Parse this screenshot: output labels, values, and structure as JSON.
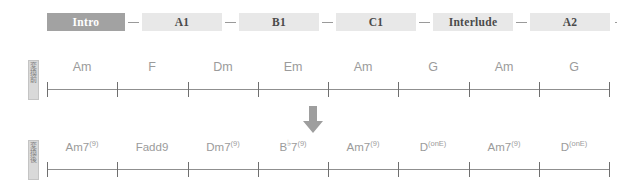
{
  "form_timeline": {
    "sections": [
      {
        "label": "Intro",
        "current": true,
        "width": 78
      },
      {
        "label": "A1",
        "current": false,
        "width": 80
      },
      {
        "label": "B1",
        "current": false,
        "width": 80
      },
      {
        "label": "C1",
        "current": false,
        "width": 80
      },
      {
        "label": "Interlude",
        "current": false,
        "width": 80
      },
      {
        "label": "A2",
        "current": false,
        "width": 80
      }
    ],
    "separator": "–"
  },
  "rows": [
    {
      "id": "original",
      "tag": "変換前",
      "measures": [
        {
          "label": "Am",
          "sup": "",
          "flat": ""
        },
        {
          "label": "F",
          "sup": "",
          "flat": ""
        },
        {
          "label": "Dm",
          "sup": "",
          "flat": ""
        },
        {
          "label": "Em",
          "sup": "",
          "flat": ""
        },
        {
          "label": "Am",
          "sup": "",
          "flat": ""
        },
        {
          "label": "G",
          "sup": "",
          "flat": ""
        },
        {
          "label": "Am",
          "sup": "",
          "flat": ""
        },
        {
          "label": "G",
          "sup": "",
          "flat": ""
        }
      ]
    },
    {
      "id": "reharm",
      "tag": "変換後",
      "measures": [
        {
          "label": "Am7",
          "sup": "(9)",
          "flat": ""
        },
        {
          "label": "Fadd9",
          "sup": "",
          "flat": ""
        },
        {
          "label": "Dm7",
          "sup": "(9)",
          "flat": ""
        },
        {
          "label": "B",
          "sup": "(9)",
          "flat": "♭",
          "after_flat": "7"
        },
        {
          "label": "Am7",
          "sup": "(9)",
          "flat": ""
        },
        {
          "label": "D",
          "sup": "(onE)",
          "flat": ""
        },
        {
          "label": "Am7",
          "sup": "(9)",
          "flat": ""
        },
        {
          "label": "D",
          "sup": "(onE)",
          "flat": ""
        }
      ]
    }
  ],
  "arrow": {
    "name": "down-arrow",
    "color": "#9e9e9e",
    "direction": "down"
  },
  "colors": {
    "chip_bg": "#e8e8e8",
    "chip_current_bg": "#a2a2a2",
    "chip_current_text": "#ffffff",
    "chip_text": "#4a4a4a",
    "staff_line": "#8f8f8f",
    "tick": "#6f6f6f",
    "chord_text": "#9b9b9b",
    "tag_bg": "#d9d9d9"
  }
}
